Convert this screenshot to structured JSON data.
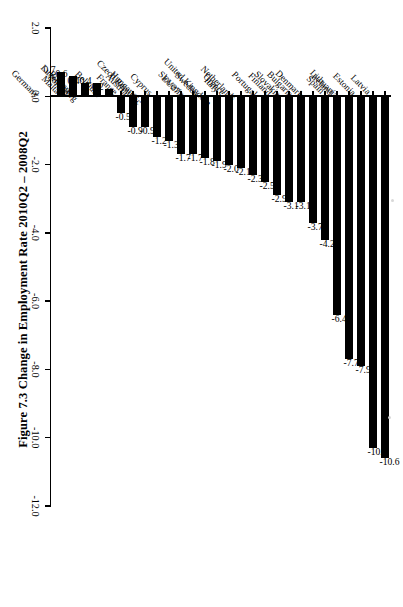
{
  "figure": {
    "title": "Figure 7.3  Change in Employment Rate 2010Q2 – 2008Q2"
  },
  "chart_data": {
    "type": "bar",
    "orientation": "horizontal",
    "title": "Figure 7.3  Change in Employment Rate 2010Q2 – 2008Q2",
    "xlabel": "",
    "ylabel": "",
    "grid": false,
    "legend": "none",
    "axis_ticks": [
      "2.0",
      "0.0",
      "-2.0",
      "-4.0",
      "-6.0",
      "-8.0",
      "-10.0",
      "-12.0"
    ],
    "axis_tick_values": [
      2.0,
      0.0,
      -2.0,
      -4.0,
      -6.0,
      -8.0,
      -10.0,
      -12.0
    ],
    "xlim": [
      2.0,
      -12.0
    ],
    "categories": [
      "Latvia",
      "Estonia",
      "Lithuania",
      "Ireland",
      "Spain",
      "Denmark",
      "Bulgaria",
      "Slovakia",
      "Finland",
      "Portugal",
      "Netherlands",
      "United Kingdom",
      "Greece",
      "Italy",
      "Sweden",
      "Slovenia",
      "EU27",
      "Czech Republic",
      "Cyprus",
      "Hungary",
      "Austria",
      "France",
      "Belgium",
      "Luxembourg",
      "Romania",
      "Poland",
      "Malta",
      "Germany"
    ],
    "values": [
      -10.6,
      -10.3,
      -7.9,
      -7.7,
      -6.4,
      -4.2,
      -3.7,
      -3.1,
      -3.1,
      -2.9,
      -2.5,
      -2.3,
      -2.1,
      -2.0,
      -1.9,
      -1.8,
      -1.7,
      -1.7,
      -1.3,
      -1.2,
      -0.9,
      -0.9,
      -0.5,
      0.2,
      0.4,
      0.4,
      0.6,
      0.7
    ],
    "value_labels": [
      "-10.6",
      "-10.3",
      "-7.9",
      "-7.7",
      "-6.4",
      "-4.2",
      "-3.7",
      "-3.1",
      "-3.1",
      "-2.9",
      "-2.5",
      "-2.3",
      "-2.1",
      "-2.0",
      "-1.9",
      "-1.8",
      "-1.7",
      "-1.7",
      "-1.3",
      "-1.2",
      "-0.9",
      "-0.9",
      "-0.5",
      "0.2",
      "0.4",
      "0.4",
      "0.6",
      "0.7"
    ],
    "bar_color": "#000000"
  }
}
